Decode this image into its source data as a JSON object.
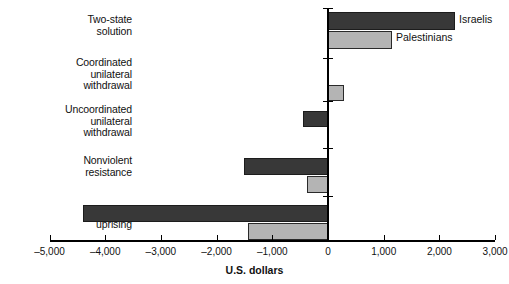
{
  "chart_data": {
    "type": "bar",
    "orientation": "horizontal",
    "title": "",
    "xlabel": "U.S. dollars",
    "ylabel": "",
    "xlim": [
      -5000,
      3000
    ],
    "xticks": [
      -5000,
      -4000,
      -3000,
      -2000,
      -1000,
      0,
      1000,
      2000,
      3000
    ],
    "xtick_labels": [
      "–5,000",
      "–4,000",
      "–3,000",
      "–2,000",
      "–1,000",
      "0",
      "1,000",
      "2,000",
      "3,000"
    ],
    "grid": false,
    "legend_position": "inline-right-of-first-group",
    "categories": [
      "Two-state solution",
      "Coordinated unilateral withdrawal",
      "Uncoordinated unilateral withdrawal",
      "Nonviolent resistance",
      "Violent uprising"
    ],
    "category_lines": [
      [
        "Two-state",
        "solution"
      ],
      [
        "Coordinated",
        "unilateral",
        "withdrawal"
      ],
      [
        "Uncoordinated",
        "unilateral",
        "withdrawal"
      ],
      [
        "Nonviolent",
        "resistance"
      ],
      [
        "Violent",
        "uprising"
      ]
    ],
    "series": [
      {
        "name": "Israelis",
        "color": "#383838",
        "values": [
          2280,
          0,
          -450,
          -1500,
          -4400
        ]
      },
      {
        "name": "Palestinians",
        "color": "#b4b4b4",
        "values": [
          1150,
          280,
          0,
          -370,
          -1430
        ]
      }
    ]
  },
  "colors": {
    "israelis": "#383838",
    "palestinians": "#b4b4b4",
    "axis": "#000000",
    "background": "#ffffff",
    "text": "#111111"
  }
}
